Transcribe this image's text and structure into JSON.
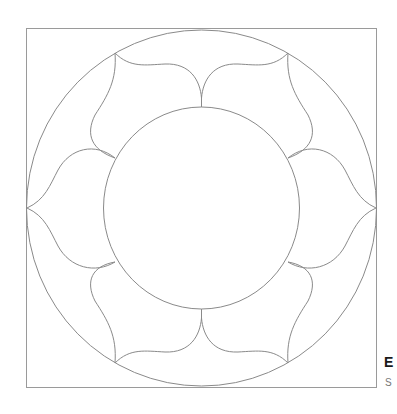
{
  "figure": {
    "stroke_color": "#8a8a8a",
    "frame_color": "#9a9a9a",
    "background": "#ffffff"
  },
  "caption": {
    "title": "E",
    "subtitle": "S"
  }
}
